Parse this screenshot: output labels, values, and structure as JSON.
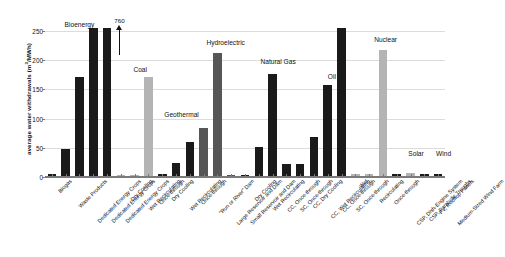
{
  "chart_data": {
    "type": "bar",
    "title": "",
    "xlabel": "",
    "ylabel": "average water withdrawals (m3/MWh)",
    "ylabel_unit_base": "average water withdrawals (m",
    "ylabel_unit_sup": "3",
    "ylabel_unit_tail": "/MWh)",
    "ylim": [
      0,
      265
    ],
    "yticks": [
      0,
      50,
      100,
      150,
      200,
      250
    ],
    "ytick_labels": [
      "0",
      "50",
      "100",
      "150",
      "200",
      "250"
    ],
    "grid": true,
    "legend": "none",
    "categories": [
      "Biogas",
      "Waste Products",
      "Dedicated Energy Crops",
      "Dedicated Energy Crops ",
      "Dedicated Energy Crops  ",
      "Dry Cooling",
      "Wet Recirculating",
      "Once-through",
      "Dry Cooling ",
      "Wet Recirculating ",
      "Once-through ",
      "\"Run or River\" Dam",
      "Large Reservoir and Dam",
      "Small Reservoir and Dam",
      "Dry Cooling  ",
      "Wet Recirculating  ",
      "CC, Once-through",
      "SC, Once-through",
      "CC, Dry Cooling",
      "CC, Wet Recirculating",
      "CC, Once-through ",
      "SC, Once-through ",
      "Wet",
      "Recirculating",
      "Once-through",
      "CSP, Dish-Engine System",
      "CSP, Parabolic Troughs",
      "PV, Rooftop Panels",
      "Medium-Sized Wind Farm"
    ],
    "values": [
      3,
      47,
      170,
      253,
      253,
      2,
      2,
      170,
      4,
      22,
      58,
      82,
      210,
      2,
      2,
      50,
      175,
      20,
      20,
      67,
      155,
      253,
      4,
      4,
      215,
      3,
      5,
      3,
      3
    ],
    "bar_colors": [
      "#1a1a1a",
      "#1a1a1a",
      "#1a1a1a",
      "#1a1a1a",
      "#1a1a1a",
      "#b4b4b4",
      "#b4b4b4",
      "#b4b4b4",
      "#1a1a1a",
      "#1a1a1a",
      "#1a1a1a",
      "#565656",
      "#565656",
      "#565656",
      "#1a1a1a",
      "#1a1a1a",
      "#1a1a1a",
      "#1a1a1a",
      "#1a1a1a",
      "#1a1a1a",
      "#1a1a1a",
      "#1a1a1a",
      "#b4b4b4",
      "#b4b4b4",
      "#b4b4b4",
      "#1a1a1a",
      "#b4b4b4",
      "#1a1a1a",
      "#1a1a1a"
    ],
    "group_labels": [
      {
        "label": "Bioenergy",
        "center_index": 2.0,
        "value_y": 258
      },
      {
        "label": "Coal",
        "center_index": 6.4,
        "value_y": 182
      },
      {
        "label": "Geothermal",
        "center_index": 9.4,
        "value_y": 105
      },
      {
        "label": "Hydroelectric",
        "center_index": 12.6,
        "value_y": 228
      },
      {
        "label": "Natural Gas",
        "center_index": 16.4,
        "value_y": 195
      },
      {
        "label": "Oil",
        "center_index": 20.3,
        "value_y": 170
      },
      {
        "label": "Nuclear",
        "center_index": 24.2,
        "value_y": 232
      },
      {
        "label": "Solar",
        "center_index": 26.4,
        "value_y": 38
      },
      {
        "label": "Wind",
        "center_index": 28.4,
        "value_y": 38
      }
    ],
    "annotations": [
      {
        "text": "760",
        "bar_index": 4.9,
        "value_y": 262,
        "type": "arrow-up"
      }
    ]
  }
}
